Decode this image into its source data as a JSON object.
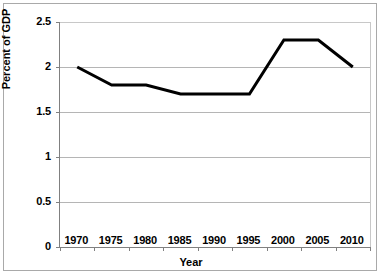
{
  "chart_data": {
    "type": "line",
    "title": "",
    "xlabel": "Year",
    "ylabel": "Percent of GDP",
    "categories": [
      "1970",
      "1975",
      "1980",
      "1985",
      "1990",
      "1995",
      "2000",
      "2005",
      "2010"
    ],
    "values": [
      2.0,
      1.8,
      1.8,
      1.7,
      1.7,
      1.7,
      2.3,
      2.3,
      2.0
    ],
    "series": [
      {
        "name": "Percent of GDP",
        "values": [
          2.0,
          1.8,
          1.8,
          1.7,
          1.7,
          1.7,
          2.3,
          2.3,
          2.0
        ],
        "color": "#000000",
        "line_width": 3
      }
    ],
    "ylim": [
      0,
      2.5
    ],
    "ytick_values": [
      0,
      0.5,
      1,
      1.5,
      2,
      2.5
    ],
    "ytick_labels": [
      "0",
      "0.5",
      "1",
      "1.5",
      "2",
      "2.5"
    ],
    "xtick_labels": [
      "1970",
      "1975",
      "1980",
      "1985",
      "1990",
      "1995",
      "2000",
      "2005",
      "2010"
    ],
    "grid": true,
    "grid_axis": "y",
    "legend": false,
    "legend_position": "none",
    "markers": false,
    "plot_background": "#ffffff",
    "grid_color": "#b5b5b5",
    "axis_color": "#808080",
    "frame_color": "#a9a9a9"
  }
}
